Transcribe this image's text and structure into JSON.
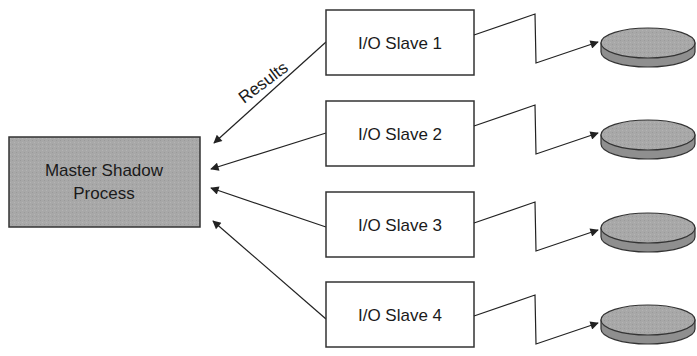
{
  "diagram": {
    "master": {
      "label_line1": "Master Shadow",
      "label_line2": "Process",
      "fill": "#a9a9a9"
    },
    "edge_label": "Results",
    "slaves": [
      {
        "label": "I/O Slave 1"
      },
      {
        "label": "I/O Slave 2"
      },
      {
        "label": "I/O Slave 3"
      },
      {
        "label": "I/O Slave 4"
      }
    ],
    "disk_colors": {
      "top": "#b5b5b5",
      "side": "#8f8f8f"
    },
    "stroke": "#222222"
  }
}
